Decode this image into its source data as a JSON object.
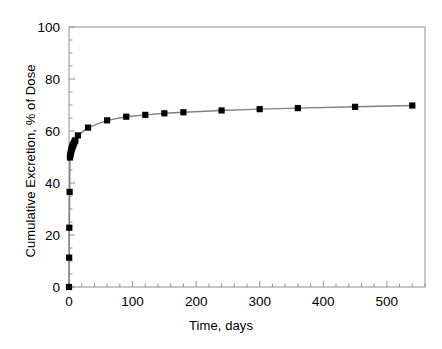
{
  "chart_data": {
    "type": "line",
    "title": "",
    "subtitle": "",
    "xlabel": "Time, days",
    "ylabel": "Cumulative Excretion, % of Dose",
    "xlim": [
      0,
      560
    ],
    "ylim": [
      0,
      100
    ],
    "x_major_ticks": [
      0,
      100,
      200,
      300,
      400,
      500
    ],
    "x_tick_labels": [
      "0",
      "100",
      "200",
      "300",
      "400",
      "500"
    ],
    "x_minor_interval": 20,
    "y_major_ticks": [
      0,
      20,
      40,
      60,
      80,
      100
    ],
    "y_tick_labels": [
      "0",
      "20",
      "40",
      "60",
      "80",
      "100"
    ],
    "y_minor_interval": 5,
    "grid": false,
    "legend": null,
    "marker": "filled-square",
    "marker_color": "#000000",
    "line_color": "#808080",
    "series": [
      {
        "name": "Cumulative Excretion",
        "x": [
          0,
          0.25,
          0.5,
          1,
          1.5,
          2,
          2.5,
          3,
          3.5,
          4,
          4.5,
          5,
          5.5,
          6,
          6.5,
          7,
          8,
          9,
          10,
          14,
          30,
          60,
          90,
          120,
          150,
          180,
          240,
          300,
          360,
          450,
          540
        ],
        "y": [
          0,
          11.3,
          22.8,
          36.6,
          49.8,
          50.6,
          51.3,
          51.9,
          52.4,
          52.9,
          53.3,
          53.7,
          54.1,
          54.4,
          54.7,
          55.0,
          55.5,
          56.0,
          56.4,
          58.3,
          61.3,
          64.1,
          65.5,
          66.2,
          66.8,
          67.2,
          67.9,
          68.4,
          68.8,
          69.3,
          69.8
        ]
      }
    ]
  }
}
